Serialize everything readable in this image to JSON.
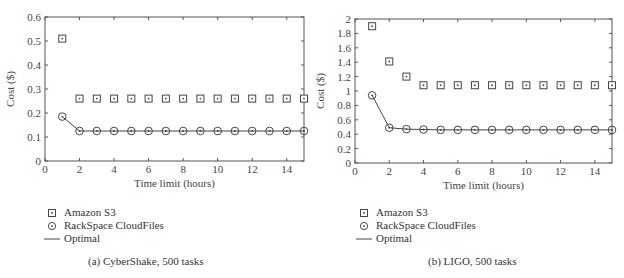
{
  "chart_data": [
    {
      "type": "scatter",
      "panel": "a",
      "caption": "(a)  CyberShake, 500 tasks",
      "xlabel": "Time limit (hours)",
      "ylabel": "Cost ($)",
      "xlim": [
        0,
        15
      ],
      "ylim": [
        0,
        0.6
      ],
      "xticks": [
        0,
        2,
        4,
        6,
        8,
        10,
        12,
        14
      ],
      "yticks": [
        0,
        0.1,
        0.2,
        0.3,
        0.4,
        0.5,
        0.6
      ],
      "ytick_labels": [
        "0",
        "0.1",
        "0.2",
        "0.3",
        "0.4",
        "0.5",
        "0.6"
      ],
      "x": [
        1,
        2,
        3,
        4,
        5,
        6,
        7,
        8,
        9,
        10,
        11,
        12,
        13,
        14,
        15
      ],
      "series": [
        {
          "name": "Amazon S3",
          "marker": "square-dot",
          "line": false,
          "values": [
            0.51,
            0.26,
            0.26,
            0.26,
            0.26,
            0.26,
            0.26,
            0.26,
            0.26,
            0.26,
            0.26,
            0.26,
            0.26,
            0.26,
            0.26
          ]
        },
        {
          "name": "RackSpace CloudFiles",
          "marker": "circle-dot",
          "line": false,
          "values": [
            0.185,
            0.125,
            0.125,
            0.125,
            0.125,
            0.125,
            0.125,
            0.125,
            0.125,
            0.125,
            0.125,
            0.125,
            0.125,
            0.125,
            0.125
          ]
        },
        {
          "name": "Optimal",
          "marker": "none",
          "line": true,
          "values": [
            0.185,
            0.125,
            0.125,
            0.125,
            0.125,
            0.125,
            0.125,
            0.125,
            0.125,
            0.125,
            0.125,
            0.125,
            0.125,
            0.125,
            0.125
          ]
        }
      ],
      "legend_position": "below"
    },
    {
      "type": "scatter",
      "panel": "b",
      "caption": "(b)  LIGO, 500 tasks",
      "xlabel": "Time limit (hours)",
      "ylabel": "Cost ($)",
      "xlim": [
        0,
        15
      ],
      "ylim": [
        0,
        2
      ],
      "xticks": [
        0,
        2,
        4,
        6,
        8,
        10,
        12,
        14
      ],
      "yticks": [
        0,
        0.2,
        0.4,
        0.6,
        0.8,
        1,
        1.2,
        1.4,
        1.6,
        1.8,
        2
      ],
      "ytick_labels": [
        "0",
        "0.2",
        "0.4",
        "0.6",
        "0.8",
        "1",
        "1.2",
        "1.4",
        "1.6",
        "1.8",
        "2"
      ],
      "x": [
        1,
        2,
        3,
        4,
        5,
        6,
        7,
        8,
        9,
        10,
        11,
        12,
        13,
        14,
        15
      ],
      "series": [
        {
          "name": "Amazon S3",
          "marker": "square-dot",
          "line": false,
          "values": [
            1.9,
            1.41,
            1.2,
            1.08,
            1.08,
            1.08,
            1.08,
            1.08,
            1.08,
            1.08,
            1.08,
            1.08,
            1.08,
            1.08,
            1.08
          ]
        },
        {
          "name": "RackSpace CloudFiles",
          "marker": "circle-dot",
          "line": false,
          "values": [
            0.94,
            0.49,
            0.47,
            0.465,
            0.46,
            0.46,
            0.46,
            0.46,
            0.46,
            0.46,
            0.46,
            0.46,
            0.46,
            0.46,
            0.46
          ]
        },
        {
          "name": "Optimal",
          "marker": "none",
          "line": true,
          "values": [
            0.94,
            0.49,
            0.47,
            0.465,
            0.46,
            0.46,
            0.46,
            0.46,
            0.46,
            0.46,
            0.46,
            0.46,
            0.46,
            0.46,
            0.46
          ]
        }
      ],
      "legend_position": "below"
    }
  ],
  "legend": {
    "items": [
      {
        "label": "Amazon S3",
        "marker": "square-dot"
      },
      {
        "label": "RackSpace CloudFiles",
        "marker": "circle-dot"
      },
      {
        "label": "Optimal",
        "marker": "line"
      }
    ]
  },
  "colors": {
    "axis": "#555555",
    "marker": "#444444",
    "text": "#333333"
  }
}
